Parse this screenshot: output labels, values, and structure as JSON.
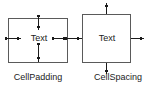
{
  "diagram": {
    "type": "concept-illustration",
    "background_color": "#ffffff",
    "line_color": "#4a4a4a",
    "arrow_color": "#1b1b1b",
    "text_color": "#1b1b1b",
    "figures": [
      {
        "id": "cellpadding",
        "caption": "CellPadding",
        "cell_text": "Text",
        "arrow_direction": "inward",
        "description": "Double-headed arrows inside the cell measuring the gap between the cell border and the text on all four sides."
      },
      {
        "id": "cellspacing",
        "caption": "CellSpacing",
        "cell_text": "Text",
        "arrow_direction": "outward",
        "description": "Arrows pointing outward from all four cell borders measuring the gap between adjacent cells."
      }
    ],
    "labels": {
      "cell_padding": "CellPadding",
      "cell_spacing": "CellSpacing",
      "text_left": "Text",
      "text_right": "Text"
    }
  }
}
